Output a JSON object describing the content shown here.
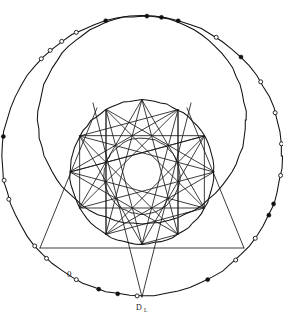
{
  "figure": {
    "background_color": "#ffffff",
    "ink_color": "#111111",
    "width": 283,
    "height": 318
  },
  "labels": [
    {
      "id": "bottom-label",
      "text": "D",
      "subscript": "L",
      "x": 141,
      "y": 309
    },
    {
      "id": "lower-left-zero",
      "text": "0",
      "x": 71,
      "y": 274
    }
  ],
  "chart_data": {
    "type": "diagram",
    "circles": [
      {
        "name": "outer-circle",
        "cx": 142,
        "cy": 156,
        "r": 140,
        "stroke": "#111111"
      },
      {
        "name": "upper-offset-circle",
        "cx": 142,
        "cy": 120,
        "r": 104,
        "stroke": "#111111"
      },
      {
        "name": "middle-circle",
        "cx": 142,
        "cy": 172,
        "r": 72,
        "stroke": "#111111"
      },
      {
        "name": "inner-circle",
        "cx": 142,
        "cy": 176,
        "r": 38,
        "stroke": "#1a1a1a"
      }
    ],
    "polygon": {
      "name": "star-polygon",
      "sides": 12,
      "step": 5,
      "cx": 142,
      "cy": 172,
      "r": 72,
      "rotation_deg": -90
    },
    "chords": [
      {
        "name": "horizontal-chord",
        "x1": 40,
        "y1": 248,
        "x2": 244,
        "y2": 248
      },
      {
        "name": "left-vertical-chord",
        "x1": 40,
        "y1": 248,
        "x2": 97,
        "y2": 108
      },
      {
        "name": "right-vertical-chord",
        "x1": 244,
        "y1": 248,
        "x2": 187,
        "y2": 108
      },
      {
        "name": "apex-left-ray",
        "x1": 142,
        "y1": 297,
        "x2": 93,
        "y2": 103
      },
      {
        "name": "apex-right-ray",
        "x1": 142,
        "y1": 297,
        "x2": 191,
        "y2": 103
      }
    ],
    "markers": {
      "filled_count": 11,
      "hollow_count": 13,
      "total": 24,
      "placement": "along outer circle circumference"
    },
    "axis_ranges": {
      "x": [
        2,
        282
      ],
      "y": [
        13,
        299
      ]
    },
    "grid": false,
    "legend": null
  },
  "outer_markers": [
    {
      "angle": -75,
      "style": "filled"
    },
    {
      "angle": -82,
      "style": "filled"
    },
    {
      "angle": -88,
      "style": "filled"
    },
    {
      "angle": -105,
      "style": "filled"
    },
    {
      "angle": -118,
      "style": "hollow"
    },
    {
      "angle": -125,
      "style": "hollow"
    },
    {
      "angle": -131,
      "style": "hollow"
    },
    {
      "angle": -136,
      "style": "hollow"
    },
    {
      "angle": -172,
      "style": "filled"
    },
    {
      "angle": 170,
      "style": "hollow"
    },
    {
      "angle": 162,
      "style": "hollow"
    },
    {
      "angle": 140,
      "style": "hollow"
    },
    {
      "angle": 133,
      "style": "hollow"
    },
    {
      "angle": 118,
      "style": "hollow"
    },
    {
      "angle": 108,
      "style": "filled"
    },
    {
      "angle": 100,
      "style": "filled"
    },
    {
      "angle": 92,
      "style": "hollow"
    },
    {
      "angle": 62,
      "style": "filled"
    },
    {
      "angle": 48,
      "style": "hollow"
    },
    {
      "angle": 36,
      "style": "hollow"
    },
    {
      "angle": 25,
      "style": "filled"
    },
    {
      "angle": 20,
      "style": "filled"
    },
    {
      "angle": 8,
      "style": "hollow"
    },
    {
      "angle": -5,
      "style": "hollow"
    },
    {
      "angle": -18,
      "style": "hollow"
    },
    {
      "angle": -32,
      "style": "hollow"
    },
    {
      "angle": -45,
      "style": "filled"
    },
    {
      "angle": -58,
      "style": "hollow"
    }
  ],
  "tick_arcs": [
    {
      "name": "upper-left-tick-arc",
      "x1": 58,
      "y1": 62,
      "x2": 108,
      "y2": 52
    },
    {
      "name": "upper-mid-tick",
      "x1": 113,
      "y1": 46,
      "x2": 124,
      "y2": 44
    },
    {
      "name": "upper-right-tick-arc",
      "x1": 152,
      "y1": 52,
      "x2": 196,
      "y2": 56
    },
    {
      "name": "left-diagonal-tick",
      "x1": 62,
      "y1": 106,
      "x2": 84,
      "y2": 66
    },
    {
      "name": "right-diagonal-tick",
      "x1": 196,
      "y1": 64,
      "x2": 232,
      "y2": 84
    }
  ]
}
